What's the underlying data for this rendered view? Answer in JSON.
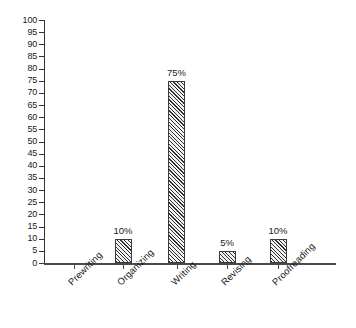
{
  "chart_data": {
    "type": "bar",
    "title": "",
    "subtitle": "",
    "xlabel": "",
    "ylabel": "",
    "categories": [
      "Prewriting",
      "Organizing",
      "Writing",
      "Revising",
      "Proofreading"
    ],
    "values": [
      0,
      10,
      75,
      5,
      10
    ],
    "data_labels": [
      "",
      "10%",
      "75%",
      "5%",
      "10%"
    ],
    "ylim": [
      0,
      100
    ],
    "ytick_step": 5,
    "ytick_labels": [
      "100",
      "95",
      "90",
      "85",
      "80",
      "75",
      "70",
      "65",
      "60",
      "55",
      "50",
      "45",
      "40",
      "35",
      "30",
      "25",
      "20",
      "15",
      "10",
      "5",
      "0"
    ],
    "grid": false,
    "legend": false,
    "legend_position": "none",
    "bar_fill": "hatched-diagonal",
    "colors": {
      "axis": "#4a4a4a",
      "bar_outline": "#3a3a3a",
      "bar_hatch": "#2f2f2f",
      "bar_background": "#f2f2f2",
      "text": "#1a1a1a",
      "page_background": "#ffffff"
    }
  }
}
